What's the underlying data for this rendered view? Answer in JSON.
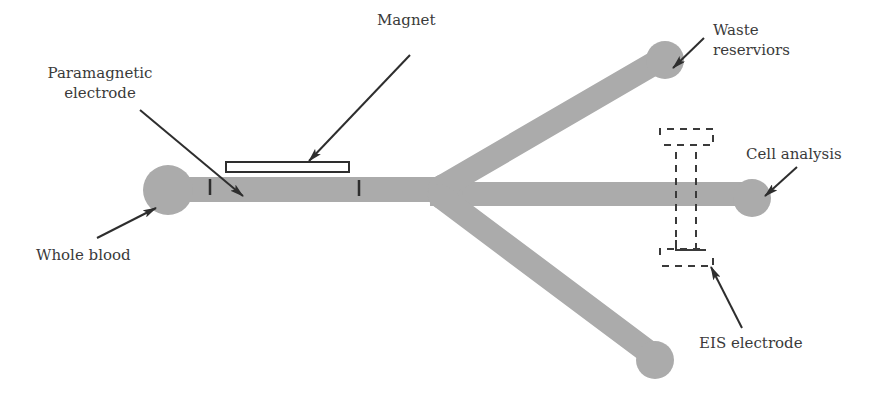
{
  "diagram": {
    "type": "microfluidic-chip-schematic",
    "colors": {
      "channel": "#ababab",
      "stroke": "#2e2e2e",
      "text": "#3a3a3a",
      "background": "#ffffff"
    },
    "labels": {
      "magnet": "Magnet",
      "paramagnetic_line1": "Paramagnetic",
      "paramagnetic_line2": "electrode",
      "waste_line1": "Waste",
      "waste_line2": "reserviors",
      "cell_analysis": "Cell analysis",
      "whole_blood": "Whole blood",
      "eis_electrode": "EIS electrode"
    },
    "components": [
      {
        "id": "inlet",
        "name": "Whole blood inlet reservoir"
      },
      {
        "id": "main-channel",
        "name": "Main channel"
      },
      {
        "id": "magnet",
        "name": "Magnet"
      },
      {
        "id": "paramagnetic-electrode",
        "name": "Paramagnetic electrode"
      },
      {
        "id": "junction",
        "name": "Trifurcation junction"
      },
      {
        "id": "upper-branch",
        "name": "Upper branch to waste reservoir"
      },
      {
        "id": "middle-branch",
        "name": "Middle branch to cell analysis"
      },
      {
        "id": "lower-branch",
        "name": "Lower branch to waste reservoir"
      },
      {
        "id": "eis-electrode",
        "name": "EIS electrode"
      }
    ]
  }
}
